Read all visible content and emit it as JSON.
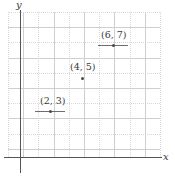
{
  "chart_data": {
    "type": "scatter",
    "title": "",
    "xlabel": "x",
    "ylabel": "y",
    "grid": true,
    "legend": null,
    "xlim": [
      0,
      10
    ],
    "ylim": [
      0,
      10
    ],
    "points": [
      {
        "label": "(2, 3)",
        "x": 2,
        "y": 3,
        "has_errorbar": true,
        "errorbar_halfwidth": 1,
        "px": 50,
        "py": 111,
        "label_px": 40,
        "label_py": 96,
        "bar_left_px": 35,
        "bar_width_px": 30,
        "bar_py": 111
      },
      {
        "label": "(4, 5)",
        "x": 4,
        "y": 5,
        "has_errorbar": false,
        "errorbar_halfwidth": 0,
        "px": 82,
        "py": 78,
        "label_px": 70,
        "label_py": 62,
        "bar_left_px": 0,
        "bar_width_px": 0,
        "bar_py": 0
      },
      {
        "label": "(6, 7)",
        "x": 6,
        "y": 7,
        "has_errorbar": true,
        "errorbar_halfwidth": 1,
        "px": 113,
        "py": 45,
        "label_px": 101,
        "label_py": 30,
        "bar_left_px": 98,
        "bar_width_px": 30,
        "bar_py": 45
      }
    ],
    "axes": {
      "x_axis_y_px": 157,
      "y_axis_x_px": 20,
      "grid_left_px": 8,
      "grid_top_px": 12,
      "grid_width_px": 152,
      "grid_height_px": 145,
      "grid_step_px": 15.2
    },
    "colors": {
      "axis": "#555555",
      "grid_solid": "#cfcfcf",
      "grid_dotted": "#d8d8d8",
      "point": "#4a4a4a",
      "errorbar": "#6e6e6e",
      "text": "#3a3a3a",
      "background": "#ffffff"
    }
  }
}
